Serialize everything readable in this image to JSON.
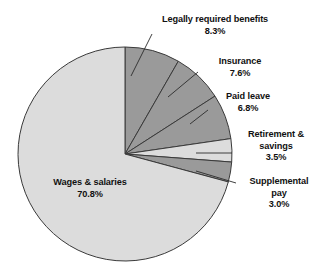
{
  "chart_data": {
    "type": "pie",
    "title": "",
    "subtitle": "",
    "xlabel": "",
    "ylabel": "",
    "legend_position": "none",
    "grid": false,
    "labels_as_callouts": true,
    "start_angle_deg": -90,
    "direction": "clockwise",
    "categories": [
      "Legally required benefits",
      "Insurance",
      "Paid leave",
      "Retirement & savings",
      "Supplemental pay",
      "Wages & salaries"
    ],
    "values": [
      8.3,
      7.6,
      6.8,
      3.5,
      3.0,
      70.8
    ],
    "value_labels": [
      "8.3%",
      "7.6%",
      "6.8%",
      "3.5%",
      "3.0%",
      "70.8%"
    ],
    "units": "percent",
    "total": 100.0,
    "slice_colors": [
      "#9a9a9a",
      "#9a9a9a",
      "#9a9a9a",
      "#dcdcdc",
      "#9a9a9a",
      "#dcdcdc"
    ],
    "slice_outline_color": "#3a3a3a",
    "background_color": "#ffffff",
    "text_color": "#111111",
    "slices": [
      {
        "name": "Legally required benefits",
        "value": 8.3,
        "value_label": "8.3%",
        "color": "#9a9a9a",
        "label_placement": "callout-top"
      },
      {
        "name": "Insurance",
        "value": 7.6,
        "value_label": "7.6%",
        "color": "#9a9a9a",
        "label_placement": "callout-right"
      },
      {
        "name": "Paid leave",
        "value": 6.8,
        "value_label": "6.8%",
        "color": "#9a9a9a",
        "label_placement": "callout-right"
      },
      {
        "name": "Retirement & savings",
        "value": 3.5,
        "value_label": "3.5%",
        "color": "#dcdcdc",
        "label_placement": "callout-right"
      },
      {
        "name": "Supplemental pay",
        "value": 3.0,
        "value_label": "3.0%",
        "color": "#9a9a9a",
        "label_placement": "callout-right"
      },
      {
        "name": "Wages & salaries",
        "value": 70.8,
        "value_label": "70.8%",
        "color": "#dcdcdc",
        "label_placement": "inside"
      }
    ]
  },
  "labels": {
    "legally": {
      "name": "Legally required benefits",
      "value": "8.3%"
    },
    "insurance": {
      "name": "Insurance",
      "value": "7.6%"
    },
    "paidleave": {
      "name": "Paid leave",
      "value": "6.8%"
    },
    "retire": {
      "name_line1": "Retirement &",
      "name_line2": "savings",
      "value": "3.5%"
    },
    "supplemental": {
      "name_line1": "Supplemental",
      "name_line2": "pay",
      "value": "3.0%"
    },
    "wages": {
      "name": "Wages & salaries",
      "value": "70.8%"
    }
  }
}
